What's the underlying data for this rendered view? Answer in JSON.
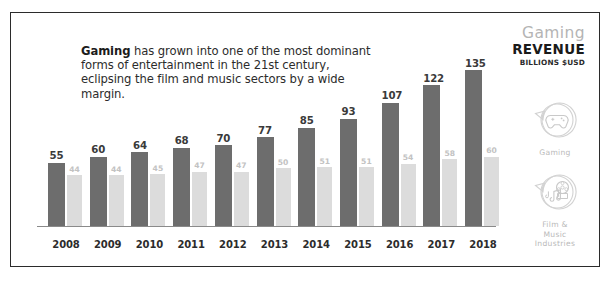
{
  "headline": {
    "lead": "Gaming",
    "rest": " has grown into one of the most dominant forms of entertainment in the 21st century, eclipsing the film and music sectors by a wide margin."
  },
  "title_block": {
    "kicker": "Gaming",
    "heading": "REVENUE",
    "units": "BILLIONS $USD"
  },
  "legend": [
    {
      "key": "gaming",
      "label": "Gaming",
      "icon": "gamepad-speech-bubble-icon",
      "color": "#6d6d6d"
    },
    {
      "key": "film_music",
      "label": "Film &\nMusic\nIndustries",
      "icon": "music-film-speech-bubble-icon",
      "color": "#dcdcdc"
    }
  ],
  "colors": {
    "bar_primary": "#6d6d6d",
    "bar_secondary": "#dcdcdc",
    "axis": "#8a8a8a",
    "border": "#2b2b2b",
    "kicker_gray": "#b4b4b4",
    "text_dark": "#2c2c2c"
  },
  "chart_data": {
    "type": "bar",
    "title": "Gaming REVENUE",
    "subtitle": "BILLIONS $USD",
    "xlabel": "",
    "ylabel": "Revenue (Billions $USD)",
    "ylim": [
      0,
      150
    ],
    "grid": false,
    "legend_position": "right",
    "categories": [
      "2008",
      "2009",
      "2010",
      "2011",
      "2012",
      "2013",
      "2014",
      "2015",
      "2016",
      "2017",
      "2018"
    ],
    "series": [
      {
        "name": "Gaming",
        "color": "#6d6d6d",
        "values": [
          55,
          60,
          64,
          68,
          70,
          77,
          85,
          93,
          107,
          122,
          135
        ]
      },
      {
        "name": "Film & Music Industries",
        "color": "#dcdcdc",
        "values": [
          44,
          44,
          45,
          47,
          47,
          50,
          51,
          51,
          54,
          58,
          60
        ]
      }
    ]
  }
}
